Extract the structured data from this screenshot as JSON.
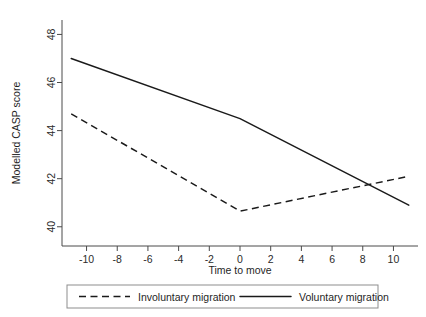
{
  "chart_data": {
    "type": "line",
    "title": "",
    "xlabel": "Time to move",
    "ylabel": "Modelled CASP score",
    "xlim": [
      -11.6,
      11.6
    ],
    "ylim": [
      39.2,
      48.6
    ],
    "xticks": [
      -10,
      -8,
      -6,
      -4,
      -2,
      0,
      2,
      4,
      6,
      8,
      10
    ],
    "xtick_labels": [
      "-10",
      "-8",
      "-6",
      "-4",
      "-2",
      "0",
      "2",
      "4",
      "6",
      "8",
      "10"
    ],
    "yticks": [
      40,
      42,
      44,
      46,
      48
    ],
    "ytick_labels": [
      "40",
      "42",
      "44",
      "46",
      "48"
    ],
    "grid": false,
    "legend_position": "bottom",
    "series": [
      {
        "name": "Involuntary migration",
        "style": "dashed",
        "color": "#1a1a1a",
        "x": [
          -11,
          0,
          11
        ],
        "values": [
          44.7,
          40.65,
          42.1
        ]
      },
      {
        "name": "Voluntary migration",
        "style": "solid",
        "color": "#1a1a1a",
        "x": [
          -11,
          0,
          11
        ],
        "values": [
          47.0,
          44.5,
          40.9
        ]
      }
    ],
    "legend": [
      {
        "label": "Involuntary migration",
        "style": "dashed"
      },
      {
        "label": "Voluntary migration",
        "style": "solid"
      }
    ]
  }
}
